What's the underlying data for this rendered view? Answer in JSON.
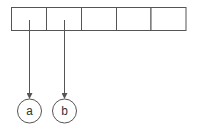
{
  "diagram": {
    "type": "array-pointer",
    "colors": {
      "stroke": "#555555",
      "background": "#ffffff",
      "text": "#333333"
    },
    "array": {
      "cell_count": 5,
      "cells": [
        "",
        "",
        "",
        "",
        ""
      ]
    },
    "pointers": [
      {
        "from_cell": 0,
        "label": "a"
      },
      {
        "from_cell": 1,
        "label": "b"
      }
    ]
  }
}
